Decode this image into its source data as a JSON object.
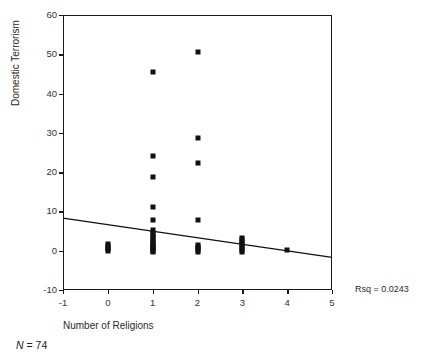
{
  "chart_data": {
    "type": "scatter",
    "title": "",
    "xlabel": "Number of Religions",
    "ylabel": "Domestic Terrorism",
    "xlim": [
      -1,
      5
    ],
    "ylim": [
      -10,
      60
    ],
    "xticks": [
      -1,
      0,
      1,
      2,
      3,
      4,
      5
    ],
    "yticks": [
      -10,
      0,
      10,
      20,
      30,
      40,
      50,
      60
    ],
    "xtick_labels": [
      "-1",
      "0",
      "1",
      "2",
      "3",
      "4",
      "5"
    ],
    "ytick_labels": [
      "-10",
      "0",
      "10",
      "20",
      "30",
      "40",
      "50",
      "60"
    ],
    "grid": false,
    "legend": null,
    "marker_style": "filled-square",
    "marker_color": "#111111",
    "points": [
      {
        "x": 0,
        "y": 0.0
      },
      {
        "x": 0,
        "y": 0.4
      },
      {
        "x": 0,
        "y": 0.8
      },
      {
        "x": 0,
        "y": 1.2
      },
      {
        "x": 0,
        "y": 1.6
      },
      {
        "x": 1,
        "y": 45.5
      },
      {
        "x": 1,
        "y": 24.0
      },
      {
        "x": 1,
        "y": 18.8
      },
      {
        "x": 1,
        "y": 11.2
      },
      {
        "x": 1,
        "y": 7.8
      },
      {
        "x": 1,
        "y": 5.2
      },
      {
        "x": 1,
        "y": 4.6
      },
      {
        "x": 1,
        "y": 4.0
      },
      {
        "x": 1,
        "y": 3.5
      },
      {
        "x": 1,
        "y": 3.0
      },
      {
        "x": 1,
        "y": 2.5
      },
      {
        "x": 1,
        "y": 2.0
      },
      {
        "x": 1,
        "y": 1.6
      },
      {
        "x": 1,
        "y": 1.2
      },
      {
        "x": 1,
        "y": 0.9
      },
      {
        "x": 1,
        "y": 0.6
      },
      {
        "x": 1,
        "y": 0.3
      },
      {
        "x": 1,
        "y": 0.0
      },
      {
        "x": 1,
        "y": -0.3
      },
      {
        "x": 2,
        "y": 50.5
      },
      {
        "x": 2,
        "y": 28.7
      },
      {
        "x": 2,
        "y": 22.3
      },
      {
        "x": 2,
        "y": 7.7
      },
      {
        "x": 2,
        "y": 1.4
      },
      {
        "x": 2,
        "y": 1.0
      },
      {
        "x": 2,
        "y": 0.6
      },
      {
        "x": 2,
        "y": 0.2
      },
      {
        "x": 2,
        "y": -0.2
      },
      {
        "x": 3,
        "y": 3.2
      },
      {
        "x": 3,
        "y": 2.7
      },
      {
        "x": 3,
        "y": 2.2
      },
      {
        "x": 3,
        "y": 1.7
      },
      {
        "x": 3,
        "y": 1.2
      },
      {
        "x": 3,
        "y": 0.7
      },
      {
        "x": 3,
        "y": 0.2
      },
      {
        "x": 3,
        "y": -0.3
      },
      {
        "x": 4,
        "y": 0.3
      }
    ],
    "fit_line": {
      "x_start": -1,
      "y_start": 8.3,
      "x_end": 5,
      "y_end": -1.7,
      "color": "#111111",
      "width": 1.3
    },
    "annotations": {
      "rsq": "Rsq = 0.0243",
      "n": "N",
      "n_value": "= 74"
    }
  }
}
